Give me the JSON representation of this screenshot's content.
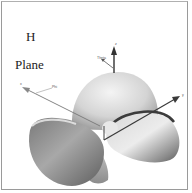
{
  "figure": {
    "title_line1": "H",
    "title_line2": "Plane"
  },
  "axes": {
    "z_label": "z",
    "theta_label": "Theta",
    "x_label": "x",
    "phi_label": "Phi",
    "y_label": "y"
  },
  "colors": {
    "background": "#ffffff",
    "border": "#9a9a9a",
    "lobe_light": "#e6e6e6",
    "lobe_dark": "#5a5a5a",
    "arrow": "#3a3a3a"
  }
}
